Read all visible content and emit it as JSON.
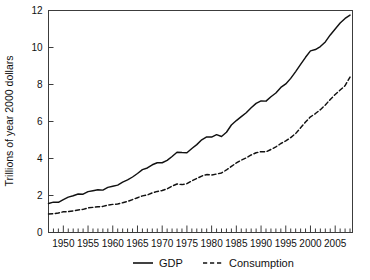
{
  "chart_data": {
    "type": "line",
    "title": "",
    "subtitle": "",
    "xlabel": "",
    "ylabel": "Trillions of year 2000 dollars",
    "xlim": [
      1947,
      2008.5
    ],
    "ylim": [
      0,
      12
    ],
    "yticks": [
      0,
      2,
      4,
      6,
      8,
      10,
      12
    ],
    "ytick_labels": [
      "0",
      "2",
      "4",
      "6",
      "8",
      "10",
      "12"
    ],
    "xticks": [
      1950,
      1955,
      1960,
      1965,
      1970,
      1975,
      1980,
      1985,
      1990,
      1995,
      2000,
      2005
    ],
    "xtick_labels": [
      "1950",
      "1955",
      "1960",
      "1965",
      "1970",
      "1975",
      "1980",
      "1985",
      "1990",
      "1995",
      "2000",
      "2005"
    ],
    "minor_xtick_interval": 1,
    "grid": false,
    "legend_position": "bottom-center",
    "x": [
      1947,
      1948,
      1949,
      1950,
      1951,
      1952,
      1953,
      1954,
      1955,
      1956,
      1957,
      1958,
      1959,
      1960,
      1961,
      1962,
      1963,
      1964,
      1965,
      1966,
      1967,
      1968,
      1969,
      1970,
      1971,
      1972,
      1973,
      1974,
      1975,
      1976,
      1977,
      1978,
      1979,
      1980,
      1981,
      1982,
      1983,
      1984,
      1985,
      1986,
      1987,
      1988,
      1989,
      1990,
      1991,
      1992,
      1993,
      1994,
      1995,
      1996,
      1997,
      1998,
      1999,
      2000,
      2001,
      2002,
      2003,
      2004,
      2005,
      2006,
      2007,
      2008
    ],
    "series": [
      {
        "name": "GDP",
        "style": "solid",
        "color": "#111111",
        "values": [
          1.57,
          1.64,
          1.63,
          1.78,
          1.91,
          1.99,
          2.08,
          2.07,
          2.21,
          2.26,
          2.31,
          2.29,
          2.44,
          2.5,
          2.56,
          2.72,
          2.84,
          3.0,
          3.19,
          3.4,
          3.49,
          3.66,
          3.77,
          3.77,
          3.9,
          4.11,
          4.34,
          4.32,
          4.31,
          4.54,
          4.75,
          5.01,
          5.17,
          5.16,
          5.29,
          5.19,
          5.42,
          5.81,
          6.05,
          6.26,
          6.47,
          6.74,
          6.98,
          7.11,
          7.1,
          7.34,
          7.54,
          7.84,
          8.03,
          8.33,
          8.7,
          9.09,
          9.47,
          9.82,
          9.89,
          10.05,
          10.3,
          10.68,
          11.0,
          11.32,
          11.57,
          11.75
        ]
      },
      {
        "name": "Consumption",
        "style": "dashed",
        "color": "#111111",
        "values": [
          1.0,
          1.02,
          1.05,
          1.12,
          1.13,
          1.17,
          1.22,
          1.25,
          1.33,
          1.36,
          1.39,
          1.41,
          1.48,
          1.52,
          1.54,
          1.61,
          1.68,
          1.78,
          1.88,
          1.98,
          2.03,
          2.14,
          2.22,
          2.27,
          2.36,
          2.51,
          2.62,
          2.59,
          2.64,
          2.79,
          2.92,
          3.05,
          3.13,
          3.11,
          3.16,
          3.22,
          3.38,
          3.57,
          3.76,
          3.91,
          4.03,
          4.19,
          4.31,
          4.37,
          4.36,
          4.49,
          4.63,
          4.81,
          4.95,
          5.13,
          5.35,
          5.66,
          5.97,
          6.25,
          6.43,
          6.64,
          6.89,
          7.19,
          7.46,
          7.7,
          7.94,
          8.4
        ]
      }
    ],
    "annotations": []
  },
  "legend": {
    "gdp_label": "GDP",
    "consumption_label": "Consumption"
  },
  "axes": {
    "y_title": "Trillions of year 2000 dollars"
  }
}
